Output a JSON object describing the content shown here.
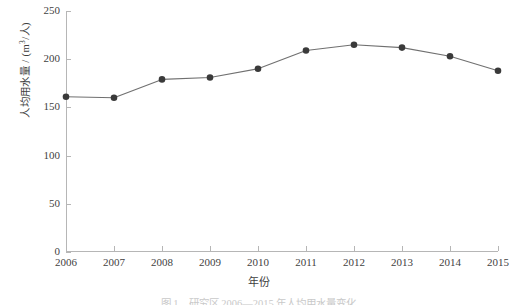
{
  "chart_data": {
    "type": "line",
    "title": "",
    "xlabel": "年份",
    "ylabel": "人均用水量 / (m³/人)",
    "ylabel_main": "人均用水量 / (m",
    "ylabel_sup": "3",
    "ylabel_tail": "/人)",
    "categories": [
      "2006",
      "2007",
      "2008",
      "2009",
      "2010",
      "2011",
      "2012",
      "2013",
      "2014",
      "2015"
    ],
    "values": [
      161,
      160,
      179,
      181,
      190,
      209,
      215,
      212,
      203,
      188
    ],
    "series": [
      {
        "name": "人均用水量",
        "values": [
          161,
          160,
          179,
          181,
          190,
          209,
          215,
          212,
          203,
          188
        ]
      }
    ],
    "ylim": [
      0,
      250
    ],
    "yticks": [
      0,
      50,
      100,
      150,
      200,
      250
    ],
    "ytick_labels": [
      "0",
      "50",
      "100",
      "150",
      "200",
      "250"
    ],
    "xlim": [
      "2006",
      "2015"
    ],
    "grid": false,
    "legend": false,
    "legend_position": "none",
    "marker": "circle",
    "colors": {
      "line": "#707070",
      "marker": "#3a3a3a",
      "axis": "#b6b6b6",
      "text": "#3f3f3f",
      "background": "#ffffff"
    }
  },
  "caption": {
    "text": "图 1　研究区 2006—2015 年人均用水量变化"
  }
}
